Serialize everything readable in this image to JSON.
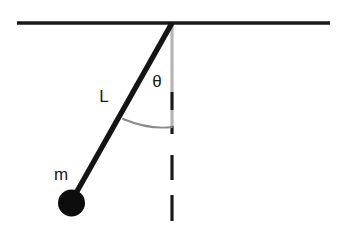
{
  "diagram": {
    "kind": "simple-pendulum-schematic",
    "background_color": "#ffffff",
    "width": 342,
    "height": 233,
    "labels": {
      "length": "L",
      "angle": "θ",
      "mass": "m"
    },
    "colors": {
      "ceiling": "#1a1a1a",
      "rod": "#141414",
      "bob": "#0d0d0d",
      "vertical_reference_faint": "#b5b5b5",
      "vertical_reference_dash": "#1a1a1a",
      "angle_arc": "#8a8a8a",
      "label_text": "#1a1a1a"
    },
    "geometry": {
      "ceiling": {
        "x1": 17,
        "y1": 23,
        "x2": 330,
        "y2": 23,
        "stroke_width": 3.6
      },
      "pivot": {
        "x": 172,
        "y": 23
      },
      "rod": {
        "x1": 172,
        "y1": 23,
        "x2": 71,
        "y2": 202,
        "stroke_width": 5.4
      },
      "bob": {
        "cx": 71.5,
        "cy": 203,
        "r": 13.5
      },
      "vertical_reference": {
        "x": 172,
        "y_top": 24,
        "y_bottom": 221,
        "faint_segments": [
          [
            24,
            92
          ],
          [
            110,
            126
          ]
        ],
        "dark_segments": [
          [
            92,
            110
          ],
          [
            126,
            134
          ],
          [
            155,
            180
          ],
          [
            195,
            221
          ]
        ],
        "stroke_width": 3.2
      },
      "angle_arc": {
        "start_x": 123,
        "start_y": 119,
        "ctrl_x": 150,
        "ctrl_y": 130,
        "end_x": 172,
        "end_y": 127,
        "stroke_width": 1.9
      },
      "label_positions": {
        "length": {
          "x": 104,
          "y": 102
        },
        "angle": {
          "x": 157,
          "y": 87
        },
        "mass": {
          "x": 61,
          "y": 180
        }
      }
    }
  }
}
